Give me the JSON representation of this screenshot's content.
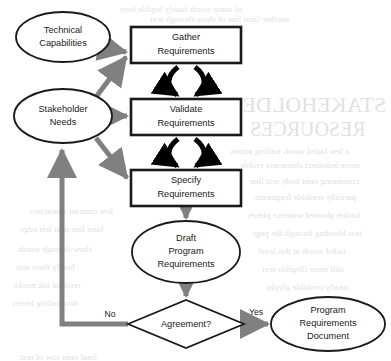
{
  "diagram": {
    "type": "flowchart",
    "colors": {
      "shape_stroke": "#1a1a1a",
      "shape_fill": "#ffffff",
      "gray_arrow": "#808080",
      "black_arrow": "#000000",
      "text": "#1a1a1a",
      "ghost": "#c9c9c9",
      "background": "#ffffff"
    },
    "nodes": [
      {
        "id": "technical-capabilities",
        "shape": "ellipse",
        "lines": [
          "Technical",
          "Capabilities"
        ],
        "cx": 63,
        "cy": 37,
        "rx": 47,
        "ry": 25
      },
      {
        "id": "stakeholder-needs",
        "shape": "ellipse",
        "lines": [
          "Stakeholder",
          "Needs"
        ],
        "cx": 63,
        "cy": 116,
        "rx": 49,
        "ry": 27
      },
      {
        "id": "gather-requirements",
        "shape": "rect",
        "lines": [
          "Gather",
          "Requirements"
        ],
        "x": 131,
        "y": 27,
        "w": 110,
        "h": 36
      },
      {
        "id": "validate-requirements",
        "shape": "rect",
        "lines": [
          "Validate",
          "Requirements"
        ],
        "x": 131,
        "y": 99,
        "w": 110,
        "h": 36
      },
      {
        "id": "specify-requirements",
        "shape": "rect",
        "lines": [
          "Specify",
          "Requirements"
        ],
        "x": 131,
        "y": 170,
        "w": 110,
        "h": 36
      },
      {
        "id": "draft-program-requirements",
        "shape": "ellipse",
        "lines": [
          "Draft",
          "Program",
          "Requirements"
        ],
        "cx": 186,
        "cy": 252,
        "rx": 54,
        "ry": 31
      },
      {
        "id": "agreement-decision",
        "shape": "diamond",
        "lines": [
          "Agreement?"
        ],
        "cx": 186,
        "cy": 324,
        "rx": 58,
        "ry": 24
      },
      {
        "id": "program-requirements-document",
        "shape": "ellipse",
        "lines": [
          "Program",
          "Requirements",
          "Document"
        ],
        "cx": 328,
        "cy": 324,
        "rx": 57,
        "ry": 27
      }
    ],
    "edge_labels": {
      "no": "No",
      "yes": "Yes"
    },
    "edges": [
      {
        "from": "technical-capabilities",
        "to": "gather-requirements",
        "style": "gray-arrow"
      },
      {
        "from": "stakeholder-needs",
        "to": "gather-requirements",
        "style": "gray-arrow"
      },
      {
        "from": "stakeholder-needs",
        "to": "validate-requirements",
        "style": "gray-arrow"
      },
      {
        "from": "stakeholder-needs",
        "to": "specify-requirements",
        "style": "gray-arrow"
      },
      {
        "from": "gather-requirements",
        "to": "validate-requirements",
        "style": "black-cycle"
      },
      {
        "from": "validate-requirements",
        "to": "specify-requirements",
        "style": "black-cycle"
      },
      {
        "from": "specify-requirements",
        "to": "draft-program-requirements",
        "style": "gray-arrow"
      },
      {
        "from": "draft-program-requirements",
        "to": "agreement-decision",
        "style": "gray-arrow"
      },
      {
        "from": "agreement-decision",
        "to": "program-requirements-document",
        "label": "Yes",
        "style": "gray-arrow"
      },
      {
        "from": "agreement-decision",
        "to": "stakeholder-needs",
        "label": "No",
        "style": "gray-arrow-feedback"
      }
    ]
  },
  "background_bleed": {
    "note": "faint mirrored show-through text from reverse page",
    "items": [
      {
        "text": "STAKEHOLDER",
        "x": 228,
        "y": 92,
        "size": 22
      },
      {
        "text": "RESOURCES",
        "x": 250,
        "y": 118,
        "size": 20
      },
      {
        "text": "of some words barely legible here",
        "x": 120,
        "y": 4,
        "size": 9
      },
      {
        "text": "another faint line of show-through text",
        "x": 150,
        "y": 14,
        "size": 9
      },
      {
        "text": "a few faded words trailing across",
        "x": 230,
        "y": 146,
        "size": 9
      },
      {
        "text": "more indistinct characters visible",
        "x": 240,
        "y": 160,
        "size": 9
      },
      {
        "text": "continuing faint body text line",
        "x": 250,
        "y": 176,
        "size": 9
      },
      {
        "text": "partially readable fragments",
        "x": 255,
        "y": 192,
        "size": 9
      },
      {
        "text": "further ghosted sentence pieces",
        "x": 248,
        "y": 210,
        "size": 9
      },
      {
        "text": "text bleeding through the page",
        "x": 252,
        "y": 228,
        "size": 9
      },
      {
        "text": "faded words at this level",
        "x": 258,
        "y": 246,
        "size": 9
      },
      {
        "text": "still more illegible text",
        "x": 262,
        "y": 264,
        "size": 9
      },
      {
        "text": "nearly invisible glyphs",
        "x": 266,
        "y": 282,
        "size": 9
      },
      {
        "text": "low contrast characters",
        "x": 30,
        "y": 206,
        "size": 9
      },
      {
        "text": "faint line near left edge",
        "x": 20,
        "y": 224,
        "size": 9
      },
      {
        "text": "show-through words",
        "x": 18,
        "y": 244,
        "size": 9
      },
      {
        "text": "barely there text",
        "x": 16,
        "y": 262,
        "size": 9
      },
      {
        "text": "residual ink marks",
        "x": 14,
        "y": 280,
        "size": 9
      },
      {
        "text": "dim trailing letters",
        "x": 12,
        "y": 298,
        "size": 9
      },
      {
        "text": "final faint row of text",
        "x": 20,
        "y": 352,
        "size": 9
      }
    ]
  }
}
